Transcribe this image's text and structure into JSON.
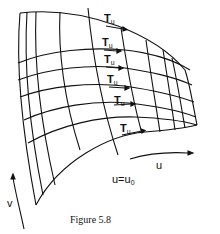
{
  "figure": {
    "caption": "Figure 5.8",
    "tangent_label": {
      "main": "T",
      "sub": "u"
    },
    "tangent_labels": [
      {
        "main": "T",
        "sub": "u",
        "x": 104,
        "y": 13
      },
      {
        "main": "T",
        "sub": "u",
        "x": 102,
        "y": 37
      },
      {
        "main": "T",
        "sub": "u",
        "x": 104,
        "y": 54
      },
      {
        "main": "T",
        "sub": "u",
        "x": 107,
        "y": 74
      },
      {
        "main": "T",
        "sub": "u",
        "x": 114,
        "y": 95
      },
      {
        "main": "T",
        "sub": "u",
        "x": 120,
        "y": 123
      }
    ],
    "u_axis_label": "u",
    "v_axis_label": "v",
    "curve_label": "u=u",
    "curve_label_sub": "0"
  }
}
